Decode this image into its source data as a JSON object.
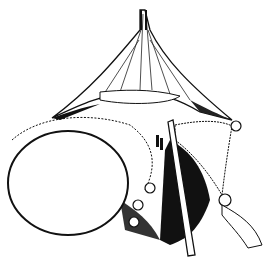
{
  "image": {
    "kind": "surgical line illustration",
    "width": 271,
    "height": 259,
    "background": "#ffffff",
    "ink": "#111111",
    "elements": [
      "retracted-tissue-tent",
      "large-oval-organ",
      "vertical-instrument",
      "suture-clips",
      "shaded-cavity"
    ]
  }
}
